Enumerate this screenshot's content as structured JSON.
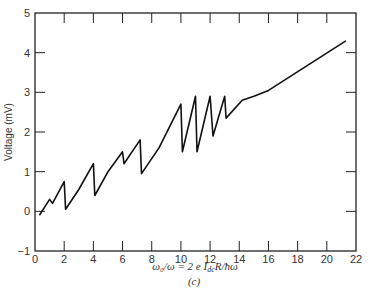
{
  "chart_data": {
    "type": "line",
    "title": "",
    "xlabel": "ω0/ω = 2 e I_dc R / ħω",
    "ylabel": "Voltage (mV)",
    "caption": "(c)",
    "xlim": [
      0,
      22
    ],
    "ylim": [
      -1,
      5
    ],
    "xticks": [
      0,
      2,
      4,
      6,
      8,
      10,
      12,
      14,
      16,
      18,
      20,
      22
    ],
    "yticks": [
      -1,
      0,
      1,
      2,
      3,
      4,
      5
    ],
    "grid": false,
    "series": [
      {
        "name": "Voltage",
        "x": [
          0.3,
          1.0,
          1.2,
          2.0,
          2.1,
          3.0,
          4.0,
          4.1,
          5.0,
          6.0,
          6.1,
          7.2,
          7.3,
          8.5,
          10.0,
          10.1,
          11.0,
          11.1,
          12.0,
          12.2,
          13.0,
          13.1,
          14.2,
          15.0,
          16.0,
          21.3
        ],
        "y": [
          -0.1,
          0.3,
          0.2,
          0.75,
          0.05,
          0.55,
          1.2,
          0.4,
          1.0,
          1.5,
          1.2,
          1.8,
          0.95,
          1.6,
          2.7,
          1.5,
          2.9,
          1.5,
          2.9,
          1.9,
          2.9,
          2.35,
          2.8,
          2.9,
          3.05,
          4.3
        ]
      }
    ]
  },
  "labels": {
    "ylabel": "Voltage (mV)",
    "xlabel_main": "ω",
    "xlabel_full": "ω₀/ω = 2 e I",
    "xlabel_sub": "dc",
    "xlabel_tail": "R/ħω",
    "caption": "(c)"
  }
}
